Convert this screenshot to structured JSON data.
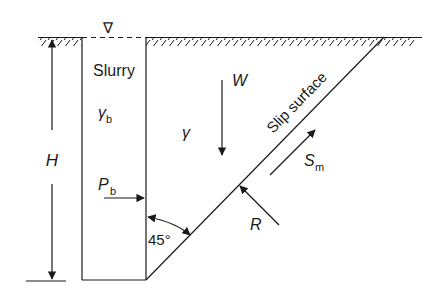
{
  "figure": {
    "type": "slurry trench stability diagram",
    "colors": {
      "line": "#1a1a1a",
      "background": "#ffffff"
    }
  },
  "labels": {
    "water_level_symbol": "∇",
    "slurry": "Slurry",
    "gamma_b_main": "γ",
    "gamma_b_sub": "b",
    "gamma": "γ",
    "weight": "W",
    "slip_surface": "Slip surface",
    "height": "H",
    "pressure_main": "P",
    "pressure_sub": "b",
    "shear_main": "S",
    "shear_sub": "m",
    "reaction": "R",
    "angle": "45°"
  }
}
